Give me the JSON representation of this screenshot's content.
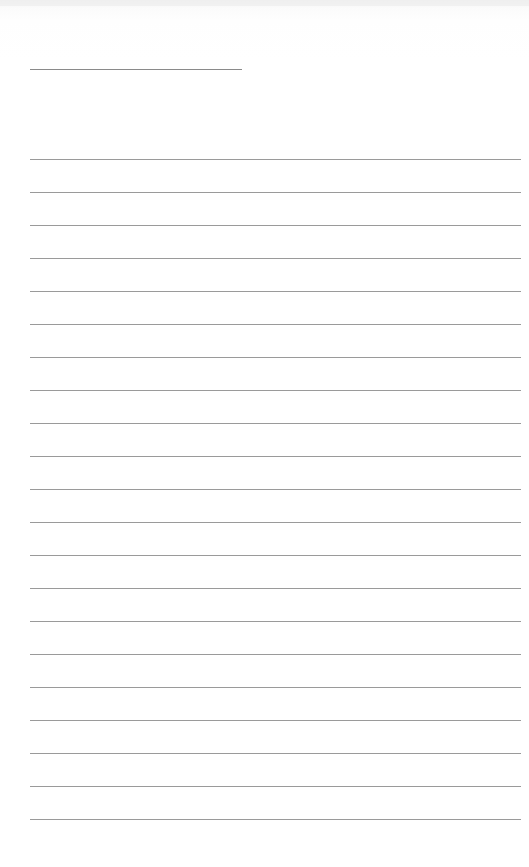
{
  "document": {
    "type": "lined-paper",
    "background_color": "#ffffff",
    "line_color": "#9a9a9a",
    "title_line": {
      "x_start": 30,
      "x_end": 242,
      "y": 69
    },
    "rules": {
      "count": 21,
      "x_start": 30,
      "x_end": 521,
      "first_y": 159,
      "spacing": 33
    },
    "text_content": []
  }
}
